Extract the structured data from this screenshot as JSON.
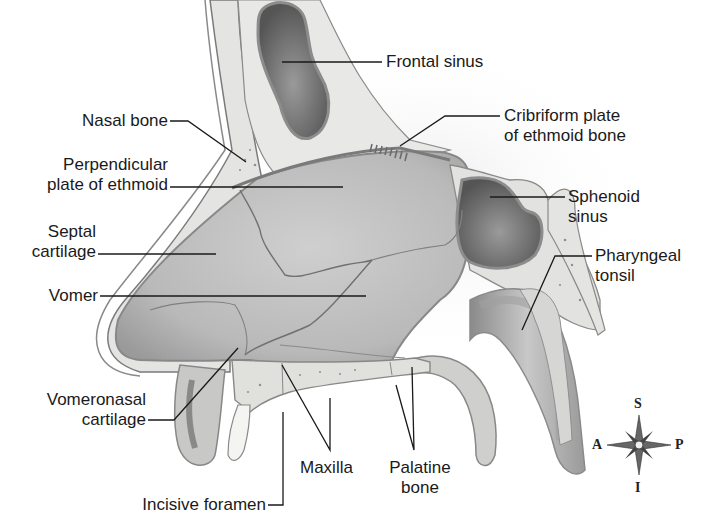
{
  "figure": {
    "labels": {
      "frontal_sinus": "Frontal sinus",
      "cribriform_plate": "Cribriform plate\nof ethmoid bone",
      "nasal_bone": "Nasal bone",
      "perpendicular_plate": "Perpendicular\nplate of ethmoid",
      "sphenoid_sinus": "Sphenoid\nsinus",
      "septal_cartilage": "Septal\ncartilage",
      "pharyngeal_tonsil": "Pharyngeal\ntonsil",
      "vomer": "Vomer",
      "vomeronasal_cartilage": "Vomeronasal\ncartilage",
      "maxilla": "Maxilla",
      "palatine_bone": "Palatine\nbone",
      "incisive_foramen": "Incisive foramen"
    },
    "compass": {
      "superior": "S",
      "inferior": "I",
      "anterior": "A",
      "posterior": "P"
    },
    "colors": {
      "background": "#ffffff",
      "bone": "#e6e6e4",
      "cavity": "#bdbdbd",
      "sinus_dark": "#6e6e6e",
      "outline": "#7a7a7a",
      "leader_line": "#1a1a1a",
      "text": "#1a1a1a"
    }
  }
}
